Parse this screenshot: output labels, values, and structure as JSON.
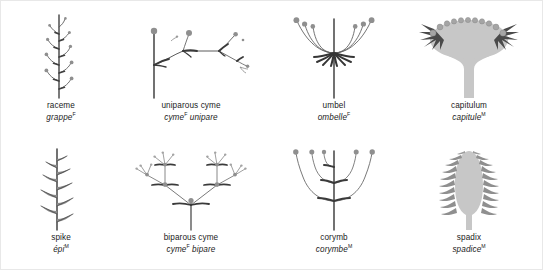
{
  "plate": {
    "title": "Types of inflorescences",
    "background_color": "#ffffff",
    "ink_color": "#4a4a4a",
    "fill_light": "#c9c9c9",
    "fill_mid": "#9a9a9a",
    "fill_dark": "#555555",
    "text_color": "#1b1b1b"
  },
  "figures": [
    {
      "id": "raceme",
      "row": 1,
      "column": 1,
      "label_en": "raceme",
      "label_fr": "grappe",
      "gender_mark": "F",
      "structure": "upright central axis bearing alternating stalked flowers along its length",
      "flower_count": 9,
      "axis": "vertical"
    },
    {
      "id": "uniparous-cyme",
      "row": 1,
      "column": 2,
      "label_en": "uniparous cyme",
      "label_fr": "cyme",
      "label_fr_suffix": "unipare",
      "gender_mark": "F",
      "structure": "vertical stalk ending in one flower, then a zig-zag series of single successively smaller lateral branches each ending in a flower",
      "flower_count": 5,
      "axis": "vertical-then-horizontal-zigzag"
    },
    {
      "id": "umbel",
      "row": 1,
      "column": 3,
      "label_en": "umbel",
      "label_fr": "ombelle",
      "gender_mark": "F",
      "structure": "long central stem from which equal curved pedicels radiate from a single point, all flowers at the same level",
      "flower_count": 6,
      "axis": "vertical"
    },
    {
      "id": "capitulum",
      "row": 1,
      "column": 4,
      "label_en": "capitulum",
      "label_fr": "capitule",
      "gender_mark": "M",
      "structure": "stalk widening into a broad flattened receptacle crowded with sessile florets along its upper arc, bracts at the rim",
      "floret_count": 17,
      "axis": "vertical"
    },
    {
      "id": "spike",
      "row": 2,
      "column": 1,
      "label_en": "spike",
      "label_fr": "épi",
      "gender_mark": "M",
      "structure": "upright axis bearing stalkless flowers directly attached in alternating arrangement",
      "flower_count": 9,
      "axis": "vertical"
    },
    {
      "id": "biparous-cyme",
      "row": 2,
      "column": 2,
      "label_en": "biparous cyme",
      "label_fr": "cyme",
      "label_fr_suffix": "bipare",
      "gender_mark": "F",
      "structure": "central stem ending in a flower, dividing into two branches that each end in a flower and divide again into two smaller branches",
      "flower_count": 15,
      "axis": "vertical"
    },
    {
      "id": "corymb",
      "row": 2,
      "column": 3,
      "label_en": "corymb",
      "label_fr": "corymbe",
      "gender_mark": "M",
      "structure": "central axis with pedicels of unequal length arising at different heights so all flowers reach the same level",
      "flower_count": 5,
      "axis": "vertical"
    },
    {
      "id": "spadix",
      "row": 2,
      "column": 4,
      "label_en": "spadix",
      "label_fr": "spadice",
      "gender_mark": "M",
      "structure": "thick fleshy axis densely covered with small sessile florets on both sides",
      "floret_count": 22,
      "axis": "vertical"
    }
  ]
}
